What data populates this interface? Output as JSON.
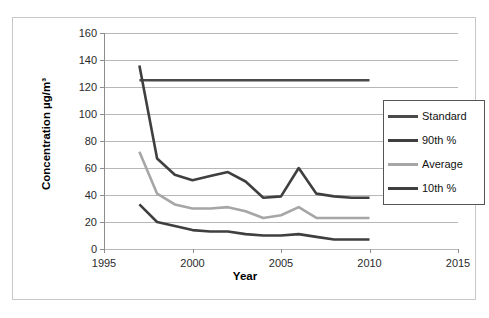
{
  "chart_data": {
    "type": "line",
    "title": "",
    "xlabel": "Year",
    "ylabel": "Concentration  µg/m³",
    "xlim": [
      1995,
      2015
    ],
    "ylim": [
      0,
      160
    ],
    "ytick_labels": [
      "0",
      "20",
      "40",
      "60",
      "80",
      "100",
      "120",
      "140",
      "160"
    ],
    "ytick_values": [
      0,
      20,
      40,
      60,
      80,
      100,
      120,
      140,
      160
    ],
    "xtick_labels": [
      "1995",
      "2000",
      "2005",
      "2010",
      "2015"
    ],
    "xtick_values": [
      1995,
      2000,
      2005,
      2010,
      2015
    ],
    "grid": "horizontal",
    "legend_position": "center-right",
    "x": [
      1997,
      1998,
      1999,
      2000,
      2001,
      2002,
      2003,
      2004,
      2005,
      2006,
      2007,
      2008,
      2009,
      2010
    ],
    "series": [
      {
        "name": "Standard",
        "color": "#4a4a4a",
        "values": [
          125,
          125,
          125,
          125,
          125,
          125,
          125,
          125,
          125,
          125,
          125,
          125,
          125,
          125
        ]
      },
      {
        "name": "90th %",
        "color": "#3f3f3f",
        "values": [
          136,
          67,
          55,
          51,
          54,
          57,
          50,
          38,
          39,
          60,
          41,
          39,
          38,
          38
        ]
      },
      {
        "name": "Average",
        "color": "#a6a6a6",
        "values": [
          72,
          41,
          33,
          30,
          30,
          31,
          28,
          23,
          25,
          31,
          23,
          23,
          23,
          23
        ]
      },
      {
        "name": "10th %",
        "color": "#3f3f3f",
        "values": [
          33,
          20,
          17,
          14,
          13,
          13,
          11,
          10,
          10,
          11,
          9,
          7,
          7,
          7
        ]
      }
    ]
  },
  "legend": {
    "items": [
      {
        "label": "Standard",
        "color": "#4a4a4a"
      },
      {
        "label": "90th %",
        "color": "#3f3f3f"
      },
      {
        "label": "Average",
        "color": "#a6a6a6"
      },
      {
        "label": "10th %",
        "color": "#3f3f3f"
      }
    ]
  },
  "axes": {
    "y_title": "Concentration  µg/m³",
    "x_title": "Year"
  },
  "colors": {
    "gridline": "#b7b7b7",
    "axis": "#8d8d8d",
    "frame": "#c8c8c8",
    "text": "#2b2b2b"
  }
}
